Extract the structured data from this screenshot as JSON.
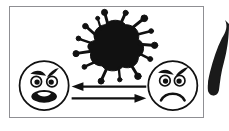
{
  "image": {
    "kind": "illustration-panel",
    "width": 229,
    "height": 131,
    "background_color": "#ffffff",
    "title": "",
    "caption": ""
  },
  "panel": {
    "border_color": "#8f8f93",
    "fill_color": "#ffffff",
    "x": 9,
    "y": 6,
    "width": 195,
    "height": 112
  },
  "ink_color": "#111111",
  "germ": {
    "label": "virus-splat",
    "color": "#111111",
    "center_x": 108,
    "center_y": 37,
    "spike_count": 14
  },
  "faces": [
    {
      "id": "left-face",
      "label": "angry-shouting-face",
      "mouth": "open-oval-shout",
      "eyebrows": "angry-slanted",
      "center_x": 42,
      "center_y": 86,
      "radius": 25,
      "outline_color": "#111111",
      "fill_color": "#ffffff"
    },
    {
      "id": "right-face",
      "label": "angry-frowning-face",
      "mouth": "frown-curve",
      "eyebrows": "angry-slanted",
      "center_x": 174,
      "center_y": 86,
      "radius": 25,
      "outline_color": "#111111",
      "fill_color": "#ffffff"
    }
  ],
  "arrows": [
    {
      "id": "arrow-left",
      "label": "arrow-pointing-left",
      "direction": "left",
      "from_x": 147,
      "to_x": 76,
      "y": 88,
      "color": "#111111"
    },
    {
      "id": "arrow-right",
      "label": "arrow-pointing-right",
      "direction": "right",
      "from_x": 72,
      "to_x": 146,
      "y": 99,
      "color": "#111111"
    }
  ],
  "edge_fragment": {
    "label": "cropped-adjacent-graphic",
    "description": "diagonal dark tapered shape clipped by the image edge",
    "color": "#1a1a1a",
    "x": 205,
    "y": 18,
    "width": 24,
    "height": 86
  }
}
